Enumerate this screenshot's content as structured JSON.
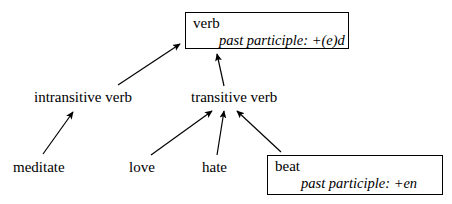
{
  "diagram": {
    "type": "inheritance-hierarchy",
    "colors": {
      "background": "#ffffff",
      "stroke": "#000000",
      "text": "#000000"
    },
    "nodes": [
      {
        "id": "verb",
        "kind": "box",
        "head": "verb",
        "feature": "past participle: +(e)d"
      },
      {
        "id": "intransitive-verb",
        "kind": "text",
        "label": "intransitive verb"
      },
      {
        "id": "transitive-verb",
        "kind": "text",
        "label": "transitive verb"
      },
      {
        "id": "meditate",
        "kind": "text",
        "label": "meditate"
      },
      {
        "id": "love",
        "kind": "text",
        "label": "love"
      },
      {
        "id": "hate",
        "kind": "text",
        "label": "hate"
      },
      {
        "id": "beat",
        "kind": "box",
        "head": "beat",
        "feature": "past participle: +en"
      }
    ],
    "edges": [
      {
        "from": "intransitive-verb",
        "to": "verb",
        "arrowhead": "filled-triangle"
      },
      {
        "from": "transitive-verb",
        "to": "verb",
        "arrowhead": "filled-triangle"
      },
      {
        "from": "meditate",
        "to": "intransitive-verb",
        "arrowhead": "filled-triangle"
      },
      {
        "from": "love",
        "to": "transitive-verb",
        "arrowhead": "filled-triangle"
      },
      {
        "from": "hate",
        "to": "transitive-verb",
        "arrowhead": "filled-triangle"
      },
      {
        "from": "beat",
        "to": "transitive-verb",
        "arrowhead": "filled-triangle"
      }
    ]
  }
}
